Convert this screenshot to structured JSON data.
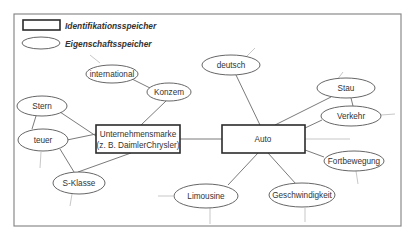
{
  "legend": {
    "identification_label": "Identifikationsspeicher",
    "property_label": "Eigenschaftsspeicher"
  },
  "nodes": {
    "unternehmensmarke": {
      "line1": "Unternehmensmarke",
      "line2": "(z. B. DaimlerChrysler)",
      "type": "Identifikationsspeicher"
    },
    "auto": {
      "label": "Auto",
      "type": "Identifikationsspeicher"
    },
    "international": {
      "label": "international",
      "type": "Eigenschaftsspeicher"
    },
    "konzem": {
      "label": "Konzem",
      "type": "Eigenschaftsspeicher"
    },
    "stern": {
      "label": "Stern",
      "type": "Eigenschaftsspeicher"
    },
    "teuer": {
      "label": "teuer",
      "type": "Eigenschaftsspeicher"
    },
    "sklasse": {
      "label": "S-Klasse",
      "type": "Eigenschaftsspeicher"
    },
    "deutsch": {
      "label": "deutsch",
      "type": "Eigenschaftsspeicher"
    },
    "stau": {
      "label": "Stau",
      "type": "Eigenschaftsspeicher"
    },
    "verkehr": {
      "label": "Verkehr",
      "type": "Eigenschaftsspeicher"
    },
    "fortbewegung": {
      "label": "Fortbewegung",
      "type": "Eigenschaftsspeicher"
    },
    "limousine": {
      "label": "Limousine",
      "type": "Eigenschaftsspeicher"
    },
    "geschwindigkeit": {
      "label": "Geschwindigkeit",
      "type": "Eigenschaftsspeicher"
    }
  },
  "edges": [
    [
      "international",
      "konzem"
    ],
    [
      "konzem",
      "unternehmensmarke"
    ],
    [
      "stern",
      "unternehmensmarke"
    ],
    [
      "stern",
      "teuer"
    ],
    [
      "teuer",
      "unternehmensmarke"
    ],
    [
      "teuer",
      "sklasse"
    ],
    [
      "sklasse",
      "unternehmensmarke"
    ],
    [
      "unternehmensmarke",
      "auto"
    ],
    [
      "deutsch",
      "auto"
    ],
    [
      "stau",
      "auto"
    ],
    [
      "stau",
      "verkehr"
    ],
    [
      "verkehr",
      "auto"
    ],
    [
      "fortbewegung",
      "auto"
    ],
    [
      "limousine",
      "auto"
    ],
    [
      "geschwindigkeit",
      "auto"
    ]
  ]
}
